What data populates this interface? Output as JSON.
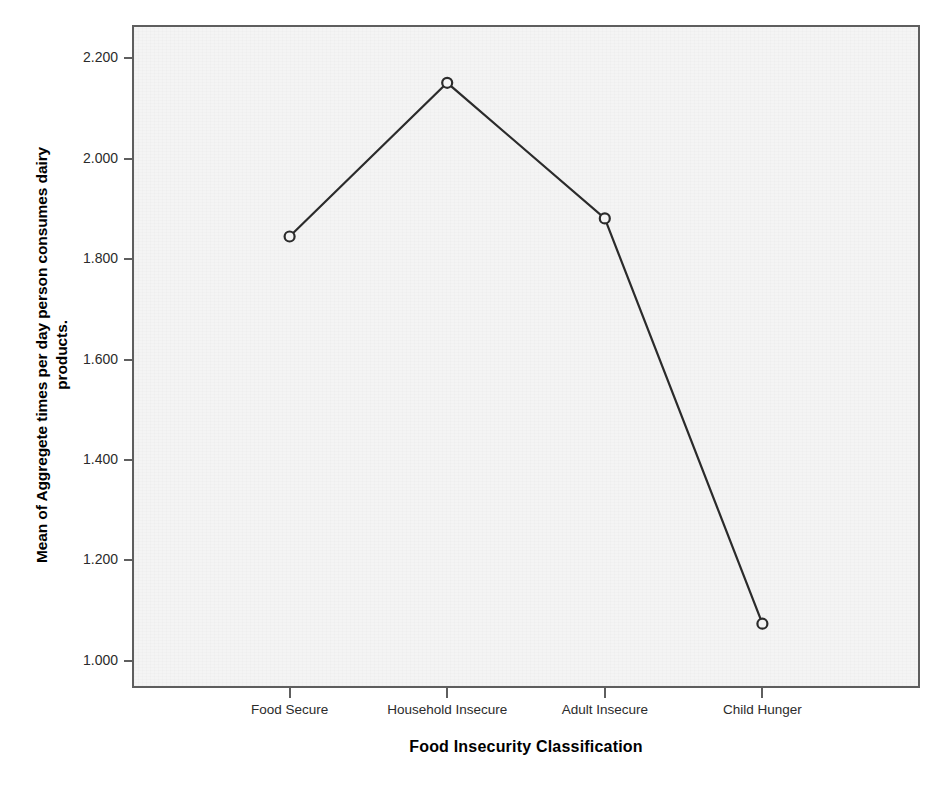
{
  "chart_data": {
    "type": "line",
    "title": "",
    "xlabel": "Food Insecurity Classification",
    "ylabel": "Mean of Aggregete times per day person consumes dairy products.",
    "ylabel_line1": "Mean of Aggregete times per day person consumes dairy",
    "ylabel_line2": "products.",
    "categories": [
      "Food Secure",
      "Household Insecure",
      "Adult Insecure",
      "Child Hunger"
    ],
    "values": [
      1.845,
      2.151,
      1.881,
      1.074
    ],
    "series": [
      {
        "name": "Mean dairy consumption",
        "values": [
          1.845,
          2.151,
          1.881,
          1.074
        ]
      }
    ],
    "ytick_labels": [
      "2.200",
      "2.000",
      "1.800",
      "1.600",
      "1.400",
      "1.200",
      "1.000"
    ],
    "ytick_values": [
      2.2,
      2.0,
      1.8,
      1.6,
      1.4,
      1.2,
      1.0
    ],
    "ylim": [
      0.946,
      2.266
    ],
    "xlim": [
      0,
      5
    ],
    "grid": false,
    "legend": "none",
    "marker": "open-circle",
    "line_color": "#2b2b2b",
    "plot_background": "#f4f4f4",
    "frame_color": "#5e5e5e"
  },
  "axis": {
    "y_title": "Mean of Aggregete times per day person consumes dairy products.",
    "x_title": "Food Insecurity Classification"
  }
}
